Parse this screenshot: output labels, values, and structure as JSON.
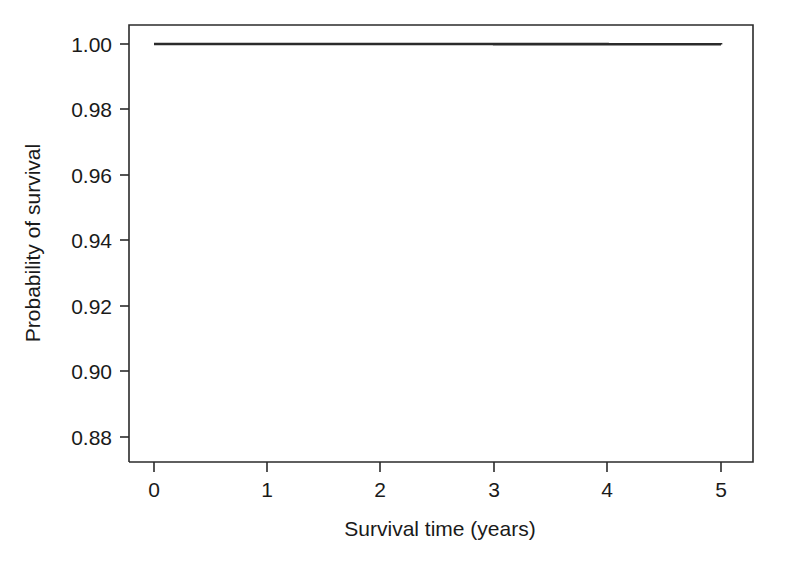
{
  "chart_data": {
    "type": "line",
    "subtype": "kaplan-meier-step",
    "title": "",
    "subtitle": "",
    "xlabel": "Survival time (years)",
    "ylabel": "Probability of survival",
    "x": [
      0,
      1,
      2,
      3,
      4,
      5
    ],
    "values": [
      1.0,
      0.995,
      0.985,
      0.965,
      0.93,
      0.88
    ],
    "series": [
      {
        "name": "Survival probability",
        "values": [
          1.0,
          0.995,
          0.985,
          0.965,
          0.93,
          0.88
        ]
      }
    ],
    "step_segments": [
      {
        "x_start": 0,
        "x_end": 1,
        "y": 1.0
      },
      {
        "x_start": 1,
        "x_end": 2,
        "y": 0.995
      },
      {
        "x_start": 2,
        "x_end": 3,
        "y": 0.985
      },
      {
        "x_start": 3,
        "x_end": 4,
        "y": 0.965
      },
      {
        "x_start": 4,
        "x_end": 5,
        "y": 0.93
      },
      {
        "x_start": 5,
        "x_end": 5,
        "y": 0.88
      }
    ],
    "xticks": [
      0,
      1,
      2,
      3,
      4,
      5
    ],
    "xtick_labels": [
      "0",
      "1",
      "2",
      "3",
      "4",
      "5"
    ],
    "yticks": [
      0.88,
      0.9,
      0.92,
      0.94,
      0.96,
      0.98,
      1.0
    ],
    "ytick_labels": [
      "0.88",
      "0.90",
      "0.92",
      "0.94",
      "0.96",
      "0.98",
      "1.00"
    ],
    "xlim": [
      -0.22,
      5.29
    ],
    "ylim": [
      0.878,
      1.0058
    ],
    "grid": false,
    "legend": false,
    "legend_position": "none",
    "line_color": "#2b2b2b",
    "axis_color": "#2b2b2b",
    "background_color": "#ffffff"
  },
  "labels": {
    "x_axis_title": "Survival time (years)",
    "y_axis_title": "Probability of survival",
    "x_tick_0": "0",
    "x_tick_1": "1",
    "x_tick_2": "2",
    "x_tick_3": "3",
    "x_tick_4": "4",
    "x_tick_5": "5",
    "y_tick_0": "1.00",
    "y_tick_1": "0.98",
    "y_tick_2": "0.96",
    "y_tick_3": "0.94",
    "y_tick_4": "0.92",
    "y_tick_5": "0.90",
    "y_tick_6": "0.88"
  }
}
